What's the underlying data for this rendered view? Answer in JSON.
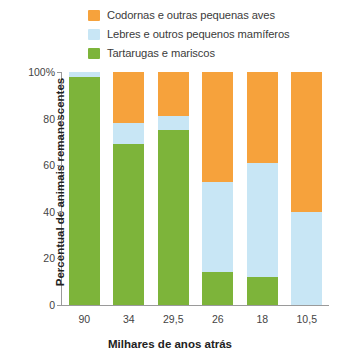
{
  "chart_data": {
    "type": "bar",
    "stacked": true,
    "normalized_percent": true,
    "title": "",
    "xlabel": "Milhares de anos atrás",
    "ylabel": "Percentual de animais remanescentes",
    "categories": [
      "90",
      "34",
      "29,5",
      "26",
      "18",
      "10,5"
    ],
    "ylim": [
      0,
      100
    ],
    "yticks": [
      0,
      20,
      40,
      60,
      80,
      100
    ],
    "ytick_labels": [
      "0",
      "20",
      "40",
      "60",
      "80",
      "100%"
    ],
    "grid": false,
    "legend_position": "top",
    "series": [
      {
        "name": "Codornas e outras pequenas aves",
        "color": "#F6A23C",
        "values": [
          0,
          22,
          19,
          47,
          39,
          60
        ]
      },
      {
        "name": "Lebres e outros pequenos mamíferos",
        "color": "#C8E6F5",
        "values": [
          2,
          9,
          6,
          39,
          49,
          40
        ]
      },
      {
        "name": "Tartarugas e mariscos",
        "color": "#7DB43A",
        "values": [
          98,
          69,
          75,
          14,
          12,
          0
        ]
      }
    ]
  }
}
